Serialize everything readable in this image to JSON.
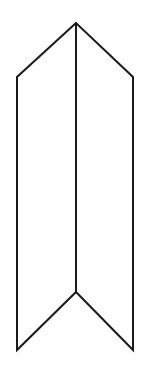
{
  "figure": {
    "title": "Folded ribbon chevron line drawing",
    "kind": "line-drawing",
    "background_color": "#ffffff",
    "stroke_color": "#1a1a1a",
    "stroke_width": 2,
    "canvas": {
      "width": 149,
      "height": 374
    },
    "vertices": {
      "apex": {
        "label": "apex",
        "x": 76,
        "y": 23
      },
      "left_shoulder": {
        "label": "left-shoulder",
        "x": 17,
        "y": 77
      },
      "right_shoulder": {
        "label": "right-shoulder",
        "x": 133,
        "y": 77
      },
      "left_bottom_tip": {
        "label": "left-bottom-tip",
        "x": 17,
        "y": 350
      },
      "right_bottom_tip": {
        "label": "right-bottom-tip",
        "x": 133,
        "y": 350
      },
      "bottom_notch": {
        "label": "bottom-notch",
        "x": 76,
        "y": 292
      }
    },
    "paths": {
      "left_panel": "M 76 23 L 17 77 L 17 350 L 76 292 Z",
      "right_panel": "M 76 23 L 133 77 L 133 350 L 76 292 Z",
      "center_fold": "M 76 23 L 76 292",
      "outline": "M 76 23 L 17 77 L 17 350 L 76 292 L 133 350 L 133 77 Z"
    },
    "segments": [
      {
        "name": "top-left-edge",
        "from": "apex",
        "to": "left-shoulder"
      },
      {
        "name": "top-right-edge",
        "from": "apex",
        "to": "right-shoulder"
      },
      {
        "name": "left-vertical-edge",
        "from": "left-shoulder",
        "to": "left-bottom-tip"
      },
      {
        "name": "right-vertical-edge",
        "from": "right-shoulder",
        "to": "right-bottom-tip"
      },
      {
        "name": "bottom-left-edge",
        "from": "left-bottom-tip",
        "to": "bottom-notch"
      },
      {
        "name": "bottom-right-edge",
        "from": "right-bottom-tip",
        "to": "bottom-notch"
      },
      {
        "name": "center-fold-line",
        "from": "apex",
        "to": "bottom-notch"
      }
    ]
  }
}
